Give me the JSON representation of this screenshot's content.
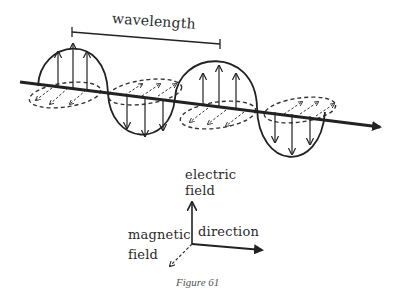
{
  "diagram": {
    "wave_label": "wavelength",
    "axes": {
      "electric_label_line1": "electric",
      "electric_label_line2": "field",
      "magnetic_label_line1": "magnetic",
      "magnetic_label_line2": "field",
      "direction_label": "direction"
    },
    "caption": "Figure 61",
    "colors": {
      "ink": "#222222",
      "background": "#ffffff",
      "caption": "#555555"
    }
  }
}
